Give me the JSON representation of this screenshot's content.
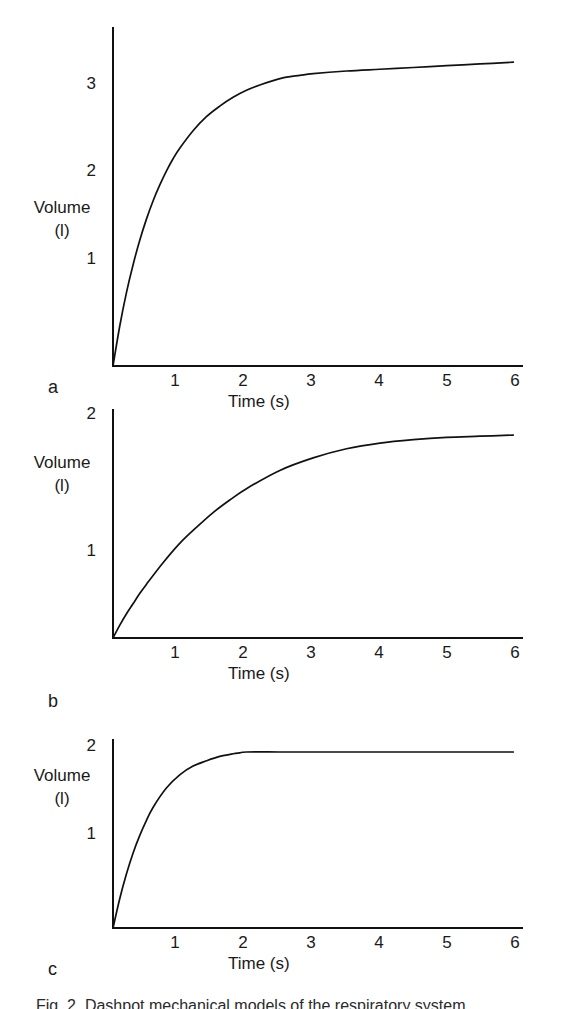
{
  "figure": {
    "caption": "Fig. 2.  Dashpot mechanical models of the respiratory system",
    "axis_color": "#111111",
    "text_color": "#1a1a1a",
    "background": "#ffffff"
  },
  "panels": [
    {
      "letter": "a",
      "ylabel_line1": "Volume",
      "ylabel_line2": "(l)",
      "xlabel": "Time  (s)",
      "yticks": [
        "1",
        "2",
        "3"
      ],
      "xticks": [
        "1",
        "2",
        "3",
        "4",
        "5",
        "6"
      ]
    },
    {
      "letter": "b",
      "ylabel_line1": "Volume",
      "ylabel_line2": "(l)",
      "xlabel": "Time  (s)",
      "yticks": [
        "1",
        "2"
      ],
      "xticks": [
        "1",
        "2",
        "3",
        "4",
        "5",
        "6"
      ]
    },
    {
      "letter": "c",
      "ylabel_line1": "Volume",
      "ylabel_line2": "(l)",
      "xlabel": "Time  (s)",
      "yticks": [
        "1",
        "2"
      ],
      "xticks": [
        "1",
        "2",
        "3",
        "4",
        "5",
        "6"
      ]
    }
  ],
  "chart_data": [
    {
      "type": "line",
      "title": "a",
      "xlabel": "Time  (s)",
      "ylabel": "Volume (l)",
      "xlim": [
        0,
        6.1
      ],
      "ylim": [
        0,
        3.6
      ],
      "xticks": [
        1,
        2,
        3,
        4,
        5,
        6
      ],
      "yticks": [
        1,
        2,
        3
      ],
      "grid": false,
      "legend": "none",
      "series": [
        {
          "name": "Volume",
          "x": [
            0,
            0.1,
            0.2,
            0.3,
            0.4,
            0.5,
            0.6,
            0.7,
            0.8,
            0.9,
            1.0,
            1.2,
            1.4,
            1.6,
            1.8,
            2.0,
            2.2,
            2.4,
            2.6,
            2.8,
            3.0,
            3.5,
            4.0,
            4.5,
            5.0,
            5.5,
            6.0
          ],
          "y": [
            0.0,
            0.45,
            0.83,
            1.15,
            1.43,
            1.67,
            1.88,
            2.06,
            2.22,
            2.36,
            2.48,
            2.68,
            2.84,
            2.96,
            3.06,
            3.14,
            3.2,
            3.25,
            3.29,
            3.31,
            3.33,
            3.36,
            3.38,
            3.4,
            3.42,
            3.44,
            3.46
          ]
        }
      ]
    },
    {
      "type": "line",
      "title": "b",
      "xlabel": "Time  (s)",
      "ylabel": "Volume (l)",
      "xlim": [
        0,
        6.1
      ],
      "ylim": [
        0,
        2.15
      ],
      "xticks": [
        1,
        2,
        3,
        4,
        5,
        6
      ],
      "yticks": [
        1,
        2
      ],
      "grid": false,
      "legend": "none",
      "series": [
        {
          "name": "Volume",
          "x": [
            0,
            0.1,
            0.2,
            0.3,
            0.4,
            0.5,
            0.75,
            1.0,
            1.25,
            1.5,
            1.75,
            2.0,
            2.5,
            3.0,
            3.5,
            4.0,
            4.5,
            5.0,
            5.5,
            6.0
          ],
          "y": [
            0.0,
            0.11,
            0.21,
            0.3,
            0.39,
            0.47,
            0.66,
            0.83,
            0.97,
            1.1,
            1.21,
            1.31,
            1.47,
            1.58,
            1.66,
            1.71,
            1.74,
            1.76,
            1.77,
            1.78
          ]
        }
      ]
    },
    {
      "type": "line",
      "title": "c",
      "xlabel": "Time  (s)",
      "ylabel": "Volume (l)",
      "xlim": [
        0,
        6.1
      ],
      "ylim": [
        0,
        2.15
      ],
      "xticks": [
        1,
        2,
        3,
        4,
        5,
        6
      ],
      "yticks": [
        1,
        2
      ],
      "grid": false,
      "legend": "none",
      "series": [
        {
          "name": "Volume",
          "x": [
            0,
            0.1,
            0.2,
            0.3,
            0.4,
            0.5,
            0.6,
            0.8,
            1.0,
            1.2,
            1.4,
            1.6,
            1.8,
            1.9,
            2.0,
            2.5,
            3.0,
            3.5,
            4.0,
            4.5,
            5.0,
            5.5,
            6.0
          ],
          "y": [
            0.0,
            0.33,
            0.61,
            0.85,
            1.05,
            1.22,
            1.37,
            1.59,
            1.74,
            1.84,
            1.9,
            1.95,
            1.98,
            1.99,
            2.0,
            2.0,
            2.0,
            2.0,
            2.0,
            2.0,
            2.0,
            2.0,
            2.0
          ]
        }
      ]
    }
  ]
}
